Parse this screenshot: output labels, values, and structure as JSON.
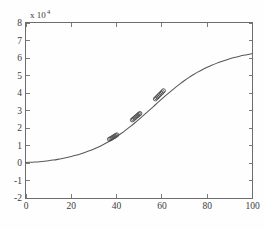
{
  "chart_data": {
    "type": "line",
    "title": "",
    "subtitle": "",
    "xlabel": "",
    "ylabel": "",
    "y_multiplier_label": "x 10",
    "y_multiplier_exponent": "4",
    "y_multiplier_value": 10000,
    "xlim": [
      0,
      100
    ],
    "ylim": [
      -2,
      8
    ],
    "xticks": [
      0,
      20,
      40,
      60,
      80,
      100
    ],
    "xticklabels": [
      "0",
      "20",
      "40",
      "60",
      "80",
      "100"
    ],
    "yticks": [
      -2,
      -1,
      0,
      1,
      2,
      3,
      4,
      5,
      6,
      7,
      8
    ],
    "yticklabels": [
      "-2",
      "-1",
      "0",
      "1",
      "2",
      "3",
      "4",
      "5",
      "6",
      "7",
      "8"
    ],
    "grid": false,
    "legend": null,
    "legend_position": "none",
    "series": [
      {
        "name": "fitted-curve",
        "type": "line",
        "color": "#585858",
        "x": [
          0,
          2,
          4,
          6,
          8,
          10,
          12,
          14,
          16,
          18,
          20,
          22,
          24,
          26,
          28,
          30,
          32,
          34,
          36,
          38,
          40,
          42,
          44,
          46,
          48,
          50,
          52,
          54,
          56,
          58,
          60,
          62,
          64,
          66,
          68,
          70,
          72,
          74,
          76,
          78,
          80,
          82,
          84,
          86,
          88,
          90,
          92,
          94,
          96,
          98,
          100
        ],
        "y": [
          300,
          420,
          570,
          760,
          1000,
          1300,
          1660,
          2080,
          2560,
          3100,
          3700,
          4380,
          5140,
          5990,
          6940,
          8000,
          9180,
          10480,
          11900,
          13440,
          15100,
          16880,
          18770,
          20770,
          22870,
          25060,
          27320,
          29630,
          31970,
          34310,
          36630,
          38900,
          41100,
          43220,
          45230,
          47130,
          48900,
          50540,
          52060,
          53450,
          54720,
          55880,
          56930,
          57890,
          58760,
          59550,
          60270,
          60920,
          61510,
          62050,
          62540
        ]
      },
      {
        "name": "observed-points-cluster-1",
        "type": "scatter",
        "marker": "circle-open",
        "color": "#4a4a4a",
        "x": [
          36.8,
          37.4,
          37.9,
          38.3,
          38.8,
          39.2,
          39.6,
          40.1
        ],
        "y": [
          13600,
          13900,
          14300,
          14600,
          15000,
          15300,
          15700,
          16100
        ]
      },
      {
        "name": "observed-points-cluster-2",
        "type": "scatter",
        "marker": "circle-open",
        "color": "#4a4a4a",
        "x": [
          46.9,
          47.4,
          47.9,
          48.4,
          48.9,
          49.4,
          49.9,
          50.3
        ],
        "y": [
          24600,
          25100,
          25700,
          26200,
          26800,
          27300,
          27900,
          28300
        ]
      },
      {
        "name": "observed-points-cluster-3",
        "type": "scatter",
        "marker": "circle-open",
        "color": "#4a4a4a",
        "x": [
          57.1,
          57.6,
          58.1,
          58.6,
          59.1,
          59.7,
          60.2,
          60.7
        ],
        "y": [
          36600,
          37200,
          37800,
          38500,
          39200,
          39900,
          40600,
          41300
        ]
      }
    ]
  }
}
